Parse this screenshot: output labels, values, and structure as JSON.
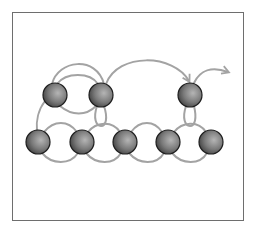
{
  "diagram": {
    "type": "beading-thread-path",
    "frame": {
      "x": 12,
      "y": 12,
      "width": 231,
      "height": 208,
      "stroke": "#6e6e6e"
    },
    "colors": {
      "thread": "#a3a3a3",
      "bead_light": "#b5b5b5",
      "bead_mid": "#7a7a7a",
      "bead_dark": "#3a3a3a",
      "bead_outline": "#1e1e1e"
    },
    "bead_radius": 12,
    "upper_row": [
      {
        "id": "u1",
        "cx": 55,
        "cy": 95
      },
      {
        "id": "u2",
        "cx": 101,
        "cy": 95
      },
      {
        "id": "u3",
        "cx": 190,
        "cy": 95
      }
    ],
    "lower_row": [
      {
        "id": "l1",
        "cx": 38,
        "cy": 142
      },
      {
        "id": "l2",
        "cx": 82,
        "cy": 142
      },
      {
        "id": "l3",
        "cx": 125,
        "cy": 142
      },
      {
        "id": "l4",
        "cx": 168,
        "cy": 142
      },
      {
        "id": "l5",
        "cx": 211,
        "cy": 142
      }
    ],
    "exit_arrow": {
      "direction": "right",
      "tip_x": 228,
      "tip_y": 72
    }
  }
}
